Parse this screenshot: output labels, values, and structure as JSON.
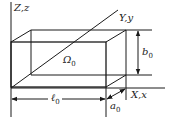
{
  "diagram": {
    "line_color": "#1a1a1a",
    "axes": {
      "z": {
        "label": "Z,z"
      },
      "y": {
        "label": "Y,y"
      },
      "x": {
        "label": "X,x"
      }
    },
    "region": {
      "label": "Ω",
      "sub": "0"
    },
    "dimensions": {
      "length": {
        "label": "ℓ",
        "sub": "0"
      },
      "width": {
        "label": "a",
        "sub": "0"
      },
      "height": {
        "label": "b",
        "sub": "0"
      }
    }
  }
}
